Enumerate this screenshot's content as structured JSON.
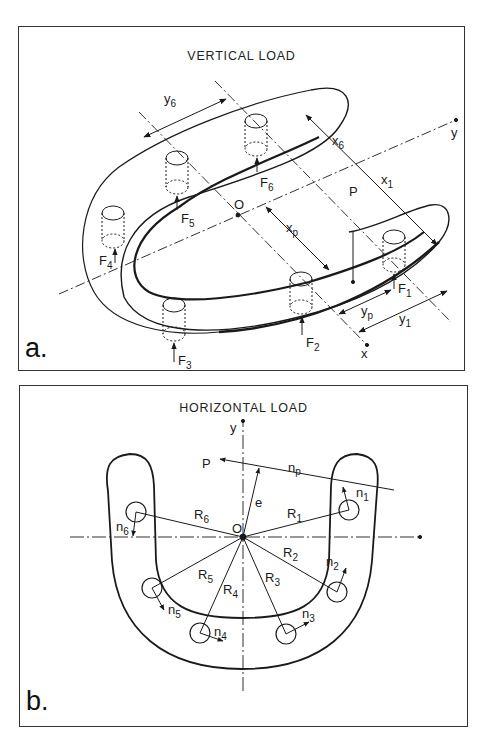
{
  "figure": {
    "panels": [
      {
        "id": "a",
        "letter": "a.",
        "title": "VERTICAL LOAD",
        "axes": {
          "x": "x",
          "y": "y",
          "origin": "O"
        },
        "load": "P",
        "forces": [
          "F1",
          "F2",
          "F3",
          "F4",
          "F5",
          "F6"
        ],
        "dimensions": [
          "y6",
          "x6",
          "x1",
          "xp",
          "yp",
          "y1"
        ]
      },
      {
        "id": "b",
        "letter": "b.",
        "title": "HORIZONTAL LOAD",
        "axes": {
          "y": "y",
          "origin": "O"
        },
        "load": "P",
        "eccentricity": "e",
        "load_direction": "np",
        "radii": [
          "R1",
          "R2",
          "R3",
          "R4",
          "R5",
          "R6"
        ],
        "normals": [
          "n1",
          "n2",
          "n3",
          "n4",
          "n5",
          "n6"
        ]
      }
    ]
  },
  "labels": {
    "a": {
      "F1": {
        "main": "F",
        "sub": "1"
      },
      "F2": {
        "main": "F",
        "sub": "2"
      },
      "F3": {
        "main": "F",
        "sub": "3"
      },
      "F4": {
        "main": "F",
        "sub": "4"
      },
      "F5": {
        "main": "F",
        "sub": "5"
      },
      "F6": {
        "main": "F",
        "sub": "6"
      },
      "y6": {
        "main": "y",
        "sub": "6"
      },
      "x6": {
        "main": "x",
        "sub": "6"
      },
      "x1": {
        "main": "x",
        "sub": "1"
      },
      "xp": {
        "main": "x",
        "sub": "p"
      },
      "yp": {
        "main": "y",
        "sub": "p"
      },
      "y1": {
        "main": "y",
        "sub": "1"
      },
      "O": "O",
      "P": "P",
      "x_axis": "x",
      "y_axis": "y"
    },
    "b": {
      "R1": {
        "main": "R",
        "sub": "1"
      },
      "R2": {
        "main": "R",
        "sub": "2"
      },
      "R3": {
        "main": "R",
        "sub": "3"
      },
      "R4": {
        "main": "R",
        "sub": "4"
      },
      "R5": {
        "main": "R",
        "sub": "5"
      },
      "R6": {
        "main": "R",
        "sub": "6"
      },
      "n1": {
        "main": "n",
        "sub": "1"
      },
      "n2": {
        "main": "n",
        "sub": "2"
      },
      "n3": {
        "main": "n",
        "sub": "3"
      },
      "n4": {
        "main": "n",
        "sub": "4"
      },
      "n5": {
        "main": "n",
        "sub": "5"
      },
      "n6": {
        "main": "n",
        "sub": "6"
      },
      "np": {
        "main": "n",
        "sub": "p"
      },
      "O": "O",
      "P": "P",
      "e": "e",
      "y_axis": "y"
    }
  },
  "colors": {
    "ink": "#1a1a1a",
    "frame": "#333333",
    "background": "#ffffff"
  }
}
